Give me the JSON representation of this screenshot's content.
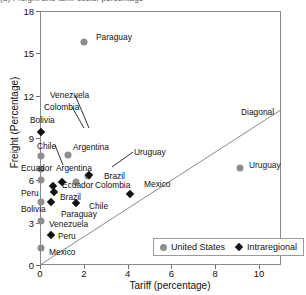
{
  "figure": {
    "cropped_header": "(a) Freight and tariff costs, percentage",
    "diagonal_label": "Diagonal"
  },
  "legend": {
    "position": "bottom-right",
    "entries": [
      {
        "label": "United States",
        "marker": "circle",
        "color": "#8e8e8e"
      },
      {
        "label": "Intraregional",
        "marker": "diamond",
        "color": "#121212"
      }
    ]
  },
  "chart_data": {
    "type": "scatter",
    "title": "",
    "xlabel": "Tariff (percentage)",
    "ylabel": "Freight (Percentage)",
    "xlim": [
      0,
      11
    ],
    "ylim": [
      0,
      18
    ],
    "xticks": [
      0,
      2,
      4,
      6,
      8,
      10
    ],
    "yticks": [
      0,
      3,
      6,
      9,
      12,
      15,
      18
    ],
    "grid": false,
    "reference_line": {
      "name": "Diagonal",
      "from": [
        0,
        0
      ],
      "to": [
        11,
        11
      ]
    },
    "series": [
      {
        "name": "United States",
        "marker": "circle",
        "color": "#8e8e8e",
        "points": [
          {
            "label": "Paraguay",
            "x": 2.0,
            "y": 15.8
          },
          {
            "label": "Argentina",
            "x": 1.3,
            "y": 7.8
          },
          {
            "label": "Chile",
            "x": 0.05,
            "y": 7.7
          },
          {
            "label": "Uruguay",
            "x": 9.15,
            "y": 6.9
          },
          {
            "label": "Ecuador",
            "x": 0.05,
            "y": 6.8
          },
          {
            "label": "Brazil",
            "x": 2.2,
            "y": 6.3
          },
          {
            "label": "Peru",
            "x": 0.05,
            "y": 6.0
          },
          {
            "label": "Colombia",
            "x": 1.65,
            "y": 5.9
          },
          {
            "label": "Bolivia",
            "x": 0.05,
            "y": 4.5
          },
          {
            "label": "Venezuela",
            "x": 0.05,
            "y": 3.15
          },
          {
            "label": "Mexico",
            "x": 0.05,
            "y": 1.2
          }
        ]
      },
      {
        "name": "Intraregional",
        "marker": "diamond",
        "color": "#121212",
        "points": [
          {
            "label": "Bolivia",
            "x": 0.05,
            "y": 9.4
          },
          {
            "label": "Colombia",
            "x": 2.25,
            "y": 6.4
          },
          {
            "label": "Argentina",
            "x": 1.0,
            "y": 5.85
          },
          {
            "label": "Ecuador",
            "x": 0.6,
            "y": 5.6
          },
          {
            "label": "Brazil",
            "x": 0.65,
            "y": 5.15
          },
          {
            "label": "Mexico",
            "x": 4.1,
            "y": 5.05
          },
          {
            "label": "Paraguay",
            "x": 0.5,
            "y": 4.45
          },
          {
            "label": "Chile",
            "x": 1.65,
            "y": 4.4
          },
          {
            "label": "Peru",
            "x": 0.5,
            "y": 2.1
          }
        ]
      }
    ],
    "annotations": [
      {
        "text": "Paraguay",
        "x": 96,
        "y": 33,
        "leader": null
      },
      {
        "text": "Venezuela",
        "x": 50,
        "y": 91,
        "leader": [
          [
            75,
            95
          ],
          [
            89,
            128
          ]
        ]
      },
      {
        "text": "Colombia",
        "x": 44,
        "y": 103,
        "leader": [
          [
            72,
            107
          ],
          [
            84,
            128
          ]
        ]
      },
      {
        "text": "Bolivia",
        "x": 30,
        "y": 116,
        "leader": null
      },
      {
        "text": "Chile",
        "x": 37,
        "y": 142,
        "leader": [
          [
            55,
            145
          ],
          [
            63,
            165
          ]
        ]
      },
      {
        "text": "Argentina",
        "x": 73,
        "y": 143,
        "leader": null
      },
      {
        "text": "Uruguay",
        "x": 134,
        "y": 148,
        "leader": [
          [
            133,
            152
          ],
          [
            112,
            167
          ]
        ]
      },
      {
        "text": "Ecuador",
        "x": 21,
        "y": 164,
        "leader": null
      },
      {
        "text": "Argentina",
        "x": 56,
        "y": 164,
        "leader": null
      },
      {
        "text": "Diagonal",
        "x": 241,
        "y": 108,
        "leader": null
      },
      {
        "text": "Uruguay",
        "x": 249,
        "y": 161,
        "leader": null
      },
      {
        "text": "Brazil",
        "x": 104,
        "y": 172,
        "leader": null
      },
      {
        "text": "Colombia",
        "x": 95,
        "y": 181,
        "leader": null
      },
      {
        "text": "Mexico",
        "x": 144,
        "y": 180,
        "leader": null
      },
      {
        "text": "Ecuador",
        "x": 62,
        "y": 181,
        "leader": null
      },
      {
        "text": "Peru",
        "x": 21,
        "y": 189,
        "leader": null
      },
      {
        "text": "Brazil",
        "x": 60,
        "y": 193,
        "leader": null
      },
      {
        "text": "Bolivia",
        "x": 21,
        "y": 205,
        "leader": null
      },
      {
        "text": "Chile",
        "x": 89,
        "y": 202,
        "leader": null
      },
      {
        "text": "Paraguay",
        "x": 61,
        "y": 210,
        "leader": null
      },
      {
        "text": "Venezuela",
        "x": 49,
        "y": 220,
        "leader": null
      },
      {
        "text": "Peru",
        "x": 58,
        "y": 232,
        "leader": null
      },
      {
        "text": "Mexico",
        "x": 49,
        "y": 248,
        "leader": null
      }
    ]
  }
}
